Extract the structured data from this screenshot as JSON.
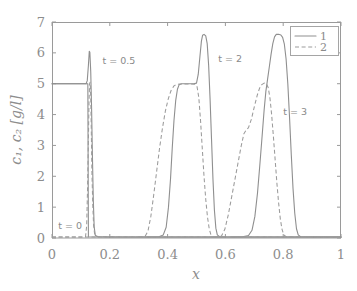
{
  "chart_data": {
    "type": "line",
    "title": "",
    "xlabel": "x",
    "ylabel": "c_1, c_2 [g/l]",
    "ylabel_display": "c₁, c₂ [g/l]",
    "xlim": [
      0,
      1
    ],
    "ylim": [
      0,
      7
    ],
    "xticks": [
      0,
      0.2,
      0.4,
      0.6,
      0.8,
      1
    ],
    "xticklabels": [
      "0",
      "0.2",
      "0.4",
      "0.6",
      "0.8",
      "1"
    ],
    "yticks": [
      0,
      1,
      2,
      3,
      4,
      5,
      6,
      7
    ],
    "yticklabels": [
      "0",
      "1",
      "2",
      "3",
      "4",
      "5",
      "6",
      "7"
    ],
    "grid": false,
    "legend": {
      "position": "top-right",
      "entries": [
        {
          "label": "1",
          "style": "solid"
        },
        {
          "label": "2",
          "style": "dashed"
        }
      ]
    },
    "annotations": [
      {
        "text": "t = 0",
        "x": 0.022,
        "y": 0.38
      },
      {
        "text": "t = 0.5",
        "x": 0.175,
        "y": 5.72
      },
      {
        "text": "t = 2",
        "x": 0.575,
        "y": 5.78
      },
      {
        "text": "t = 3",
        "x": 0.8,
        "y": 4.08
      }
    ],
    "series": [
      {
        "name": "1",
        "style": "solid",
        "profiles": [
          {
            "t": 0,
            "points": [
              [
                0.0,
                5.0
              ],
              [
                0.12,
                5.0
              ],
              [
                0.124,
                5.0
              ],
              [
                0.126,
                0.04
              ],
              [
                0.2,
                0.03
              ],
              [
                0.4,
                0.03
              ],
              [
                0.6,
                0.03
              ],
              [
                0.8,
                0.03
              ],
              [
                1.0,
                0.03
              ]
            ]
          },
          {
            "t": 0.5,
            "points": [
              [
                0.0,
                5.0
              ],
              [
                0.1,
                5.0
              ],
              [
                0.118,
                5.0
              ],
              [
                0.122,
                5.1
              ],
              [
                0.126,
                5.6
              ],
              [
                0.129,
                6.05
              ],
              [
                0.131,
                6.02
              ],
              [
                0.134,
                5.4
              ],
              [
                0.137,
                4.2
              ],
              [
                0.14,
                2.6
              ],
              [
                0.143,
                1.2
              ],
              [
                0.146,
                0.35
              ],
              [
                0.15,
                0.08
              ],
              [
                0.16,
                0.04
              ],
              [
                0.3,
                0.03
              ],
              [
                0.6,
                0.03
              ],
              [
                1.0,
                0.03
              ]
            ]
          },
          {
            "t": 2,
            "points": [
              [
                0.33,
                0.03
              ],
              [
                0.37,
                0.04
              ],
              [
                0.385,
                0.1
              ],
              [
                0.395,
                0.35
              ],
              [
                0.403,
                1.0
              ],
              [
                0.41,
                1.9
              ],
              [
                0.416,
                2.9
              ],
              [
                0.422,
                3.8
              ],
              [
                0.428,
                4.45
              ],
              [
                0.434,
                4.82
              ],
              [
                0.44,
                4.97
              ],
              [
                0.448,
                5.0
              ],
              [
                0.47,
                5.0
              ],
              [
                0.49,
                5.0
              ],
              [
                0.5,
                5.02
              ],
              [
                0.506,
                5.3
              ],
              [
                0.512,
                5.9
              ],
              [
                0.517,
                6.38
              ],
              [
                0.521,
                6.57
              ],
              [
                0.526,
                6.6
              ],
              [
                0.532,
                6.55
              ],
              [
                0.537,
                6.3
              ],
              [
                0.542,
                5.6
              ],
              [
                0.547,
                4.5
              ],
              [
                0.552,
                3.2
              ],
              [
                0.557,
                1.9
              ],
              [
                0.562,
                0.9
              ],
              [
                0.567,
                0.32
              ],
              [
                0.572,
                0.1
              ],
              [
                0.58,
                0.04
              ],
              [
                0.6,
                0.03
              ]
            ]
          },
          {
            "t": 3,
            "points": [
              [
                0.62,
                0.03
              ],
              [
                0.66,
                0.04
              ],
              [
                0.68,
                0.08
              ],
              [
                0.692,
                0.25
              ],
              [
                0.702,
                0.7
              ],
              [
                0.711,
                1.45
              ],
              [
                0.719,
                2.35
              ],
              [
                0.727,
                3.3
              ],
              [
                0.734,
                4.15
              ],
              [
                0.74,
                4.75
              ],
              [
                0.746,
                5.15
              ],
              [
                0.752,
                5.55
              ],
              [
                0.758,
                5.95
              ],
              [
                0.764,
                6.3
              ],
              [
                0.77,
                6.52
              ],
              [
                0.776,
                6.6
              ],
              [
                0.784,
                6.6
              ],
              [
                0.792,
                6.58
              ],
              [
                0.798,
                6.5
              ],
              [
                0.804,
                6.28
              ],
              [
                0.81,
                5.8
              ],
              [
                0.816,
                5.0
              ],
              [
                0.822,
                3.9
              ],
              [
                0.828,
                2.7
              ],
              [
                0.834,
                1.6
              ],
              [
                0.84,
                0.8
              ],
              [
                0.846,
                0.3
              ],
              [
                0.852,
                0.1
              ],
              [
                0.86,
                0.04
              ],
              [
                0.9,
                0.03
              ],
              [
                1.0,
                0.03
              ]
            ]
          }
        ]
      },
      {
        "name": "2",
        "style": "dashed",
        "profiles": [
          {
            "t": 0,
            "points": [
              [
                0.0,
                0.03
              ],
              [
                0.11,
                0.03
              ],
              [
                0.12,
                0.03
              ],
              [
                0.124,
                0.03
              ],
              [
                0.2,
                0.03
              ],
              [
                0.5,
                0.03
              ],
              [
                1.0,
                0.03
              ]
            ]
          },
          {
            "t": 0.5,
            "points": [
              [
                0.0,
                0.03
              ],
              [
                0.1,
                0.03
              ],
              [
                0.116,
                0.04
              ],
              [
                0.12,
                0.4
              ],
              [
                0.123,
                1.6
              ],
              [
                0.126,
                3.2
              ],
              [
                0.128,
                4.4
              ],
              [
                0.13,
                5.0
              ],
              [
                0.132,
                5.05
              ],
              [
                0.134,
                4.6
              ],
              [
                0.136,
                3.5
              ],
              [
                0.138,
                2.2
              ],
              [
                0.141,
                1.1
              ],
              [
                0.144,
                0.4
              ],
              [
                0.148,
                0.1
              ],
              [
                0.156,
                0.04
              ],
              [
                0.3,
                0.03
              ],
              [
                1.0,
                0.03
              ]
            ]
          },
          {
            "t": 2,
            "points": [
              [
                0.3,
                0.03
              ],
              [
                0.322,
                0.05
              ],
              [
                0.332,
                0.22
              ],
              [
                0.342,
                0.7
              ],
              [
                0.352,
                1.4
              ],
              [
                0.362,
                2.15
              ],
              [
                0.372,
                2.9
              ],
              [
                0.382,
                3.55
              ],
              [
                0.392,
                4.1
              ],
              [
                0.402,
                4.5
              ],
              [
                0.412,
                4.78
              ],
              [
                0.422,
                4.93
              ],
              [
                0.432,
                4.98
              ],
              [
                0.442,
                4.99
              ],
              [
                0.46,
                4.99
              ],
              [
                0.48,
                4.99
              ],
              [
                0.495,
                4.98
              ],
              [
                0.502,
                4.9
              ],
              [
                0.508,
                4.55
              ],
              [
                0.514,
                3.8
              ],
              [
                0.52,
                2.9
              ],
              [
                0.526,
                2.0
              ],
              [
                0.532,
                1.25
              ],
              [
                0.538,
                0.68
              ],
              [
                0.544,
                0.3
              ],
              [
                0.55,
                0.1
              ],
              [
                0.558,
                0.04
              ],
              [
                0.58,
                0.03
              ]
            ]
          },
          {
            "t": 3,
            "points": [
              [
                0.56,
                0.03
              ],
              [
                0.586,
                0.06
              ],
              [
                0.598,
                0.28
              ],
              [
                0.61,
                0.75
              ],
              [
                0.622,
                1.35
              ],
              [
                0.634,
                1.95
              ],
              [
                0.644,
                2.45
              ],
              [
                0.654,
                2.95
              ],
              [
                0.664,
                3.38
              ],
              [
                0.672,
                3.5
              ],
              [
                0.68,
                3.58
              ],
              [
                0.69,
                3.85
              ],
              [
                0.7,
                4.25
              ],
              [
                0.71,
                4.62
              ],
              [
                0.718,
                4.85
              ],
              [
                0.726,
                4.97
              ],
              [
                0.734,
                5.02
              ],
              [
                0.742,
                5.0
              ],
              [
                0.748,
                4.88
              ],
              [
                0.754,
                4.55
              ],
              [
                0.76,
                4.0
              ],
              [
                0.766,
                3.3
              ],
              [
                0.772,
                2.55
              ],
              [
                0.778,
                1.8
              ],
              [
                0.784,
                1.15
              ],
              [
                0.79,
                0.62
              ],
              [
                0.796,
                0.28
              ],
              [
                0.802,
                0.1
              ],
              [
                0.81,
                0.04
              ],
              [
                0.84,
                0.03
              ],
              [
                1.0,
                0.03
              ]
            ]
          }
        ]
      }
    ]
  },
  "figure": {
    "plot_area": {
      "left": 52,
      "top": 22,
      "right": 341,
      "bottom": 238
    }
  }
}
